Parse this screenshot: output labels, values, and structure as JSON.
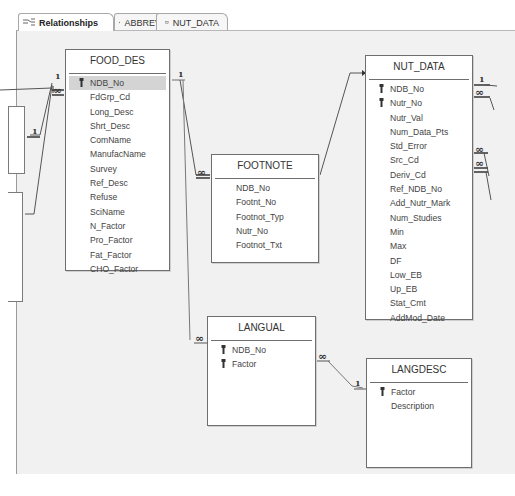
{
  "tabs": [
    {
      "label": "Relationships",
      "icon": "relationships-icon",
      "active": true
    },
    {
      "label": "ABBREV",
      "icon": "table-icon",
      "active": false
    },
    {
      "label": "NUT_DATA",
      "icon": "table-icon",
      "active": false
    }
  ],
  "tables": {
    "food_des": {
      "title": "FOOD_DES",
      "fields": [
        "NDB_No",
        "FdGrp_Cd",
        "Long_Desc",
        "Shrt_Desc",
        "ComName",
        "ManufacName",
        "Survey",
        "Ref_Desc",
        "Refuse",
        "SciName",
        "N_Factor",
        "Pro_Factor",
        "Fat_Factor",
        "CHO_Factor"
      ],
      "key_fields": [
        "NDB_No"
      ]
    },
    "footnote": {
      "title": "FOOTNOTE",
      "fields": [
        "NDB_No",
        "Footnt_No",
        "Footnot_Typ",
        "Nutr_No",
        "Footnot_Txt"
      ],
      "key_fields": []
    },
    "nut_data": {
      "title": "NUT_DATA",
      "fields": [
        "NDB_No",
        "Nutr_No",
        "Nutr_Val",
        "Num_Data_Pts",
        "Std_Error",
        "Src_Cd",
        "Deriv_Cd",
        "Ref_NDB_No",
        "Add_Nutr_Mark",
        "Num_Studies",
        "Min",
        "Max",
        "DF",
        "Low_EB",
        "Up_EB",
        "Stat_Cmt",
        "AddMod_Date"
      ],
      "key_fields": [
        "NDB_No",
        "Nutr_No"
      ]
    },
    "langual": {
      "title": "LANGUAL",
      "fields": [
        "NDB_No",
        "Factor"
      ],
      "key_fields": [
        "NDB_No",
        "Factor"
      ]
    },
    "langdesc": {
      "title": "LANGDESC",
      "fields": [
        "Factor",
        "Description"
      ],
      "key_fields": [
        "Factor"
      ]
    }
  },
  "relationship_labels": {
    "one": "1",
    "many": "∞"
  }
}
